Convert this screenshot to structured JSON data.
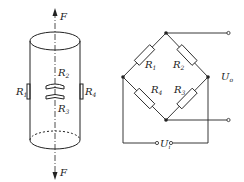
{
  "cylinder": {
    "force_top": "F",
    "force_bottom": "F",
    "gauges": [
      {
        "name": "R",
        "sub": "1",
        "position": "left"
      },
      {
        "name": "R",
        "sub": "2",
        "position": "center-top"
      },
      {
        "name": "R",
        "sub": "3",
        "position": "center-bottom"
      },
      {
        "name": "R",
        "sub": "4",
        "position": "right"
      }
    ]
  },
  "bridge": {
    "resistors": [
      {
        "name": "R",
        "sub": "1",
        "position": "top-left"
      },
      {
        "name": "R",
        "sub": "2",
        "position": "top-right"
      },
      {
        "name": "R",
        "sub": "4",
        "position": "bottom-left"
      },
      {
        "name": "R",
        "sub": "3",
        "position": "bottom-right"
      }
    ],
    "output": {
      "name": "U",
      "sub": "o"
    },
    "input": {
      "name": "U",
      "sub": "i"
    }
  },
  "colors": {
    "line": "#222222",
    "background": "#ffffff"
  }
}
